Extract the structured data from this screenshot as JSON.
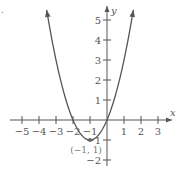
{
  "chart_data": {
    "type": "line",
    "title": "",
    "xlabel": "x",
    "ylabel": "y",
    "xlim": [
      -5.5,
      3.7
    ],
    "ylim": [
      -2.3,
      5.6
    ],
    "x_ticks": [
      -5,
      -4,
      -3,
      -2,
      -1,
      1,
      2,
      3
    ],
    "y_ticks": [
      -2,
      -1,
      1,
      2,
      3,
      4,
      5
    ],
    "x_tick_labels": [
      "−5",
      "−4",
      "−3",
      "−2",
      "−1",
      "1",
      "2",
      "3"
    ],
    "y_tick_labels": [
      "−2",
      "−1",
      "1",
      "2",
      "3",
      "4",
      "5"
    ],
    "grid": false,
    "series": [
      {
        "name": "parabola",
        "equation": "y = x^2 + 2x",
        "x": [
          -3.55,
          -3,
          -2.5,
          -2,
          -1.5,
          -1,
          -0.5,
          0,
          0.5,
          1,
          1.55
        ],
        "y": [
          5.5,
          3,
          1.25,
          0,
          -0.75,
          -1,
          -0.75,
          0,
          1.25,
          3,
          5.5
        ],
        "arrows_at_ends": true,
        "color": "#555555"
      }
    ],
    "points": [
      {
        "x": -1,
        "y": -1,
        "label": "(−1, 1)"
      }
    ],
    "annotations": [
      "(−1, 1)"
    ],
    "legend": null
  },
  "labels": {
    "x_axis": "x",
    "y_axis": "y",
    "vertex": "(−1, 1)",
    "corner_mark": "."
  },
  "colors": {
    "curve": "#555555",
    "axis": "#555555",
    "text": "#555555",
    "annotation": "#777777"
  }
}
